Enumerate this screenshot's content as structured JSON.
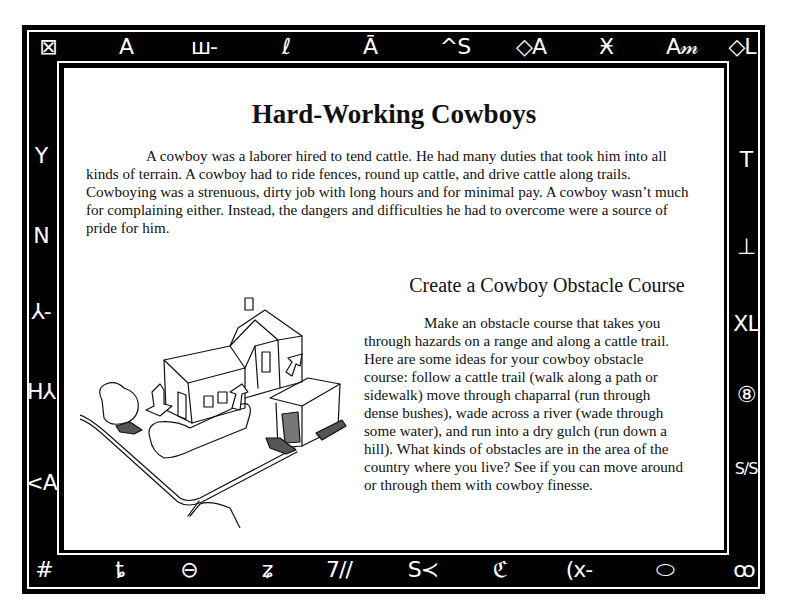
{
  "page": {
    "title": "Hard-Working Cowboys",
    "intro_paragraph": "A cowboy was a laborer hired to tend cattle. He had many duties that took him into all kinds of terrain. A cowboy had to ride fences, round up cattle, and drive cattle along trails. Cowboying was a strenuous, dirty job with long hours and for minimal pay. A cowboy wasn’t much for complaining either. Instead, the dangers and difficulties he had to overcome were a source of pride for him.",
    "activity": {
      "heading": "Create a Cowboy Obstacle Course",
      "body": "Make an obstacle course that takes you through hazards on a range and along a cattle trail. Here are some ideas for your cowboy obstacle course: follow a cattle trail (walk along a path or sidewalk) move through chaparral (run through dense bushes), wade across a river (wade through some water),  and run into a dry gulch (run down a hill). What kinds of obstacles are in the area of the country where you live? See if you can move around or through them with cowboy finesse."
    },
    "illustration": {
      "description": "Sketch of a house, garage, hedges and a winding path with arrows marking an obstacle course route"
    }
  },
  "border": {
    "background_color": "#000000",
    "line_color": "#ffffff",
    "brands_top": [
      "⊠",
      "A",
      "ш-",
      "ℓ",
      "Ā",
      "^S",
      "◇A",
      "Ӿ",
      "A𝓂",
      "◇L"
    ],
    "brands_bottom": [
      "#",
      "ȶ",
      "⊖",
      "ʑ",
      "7//",
      "S≺",
      "ℭ",
      "(x-",
      "⬭",
      "ꝏ"
    ],
    "brands_left": [
      "Y",
      "N",
      "⅄-",
      "H⅄",
      "<A"
    ],
    "brands_right": [
      "T",
      "⊥",
      "XL",
      "⑧",
      "S/S"
    ]
  }
}
